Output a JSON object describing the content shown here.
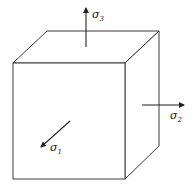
{
  "diagram": {
    "colors": {
      "stroke": "#3a3a3a",
      "arrow": "#222222",
      "background": "#ffffff"
    },
    "cube": {
      "front": {
        "x1": 13,
        "y1": 63,
        "x2": 125,
        "y2": 179
      },
      "back_offset": {
        "dx": 34,
        "dy": -32
      }
    },
    "stresses": [
      {
        "id": "sigma1",
        "symbol": "σ",
        "subscript": "1",
        "direction": "out-of-front-face (diagonal)"
      },
      {
        "id": "sigma2",
        "symbol": "σ",
        "subscript": "2",
        "direction": "right"
      },
      {
        "id": "sigma3",
        "symbol": "σ",
        "subscript": "3",
        "direction": "up"
      }
    ]
  }
}
